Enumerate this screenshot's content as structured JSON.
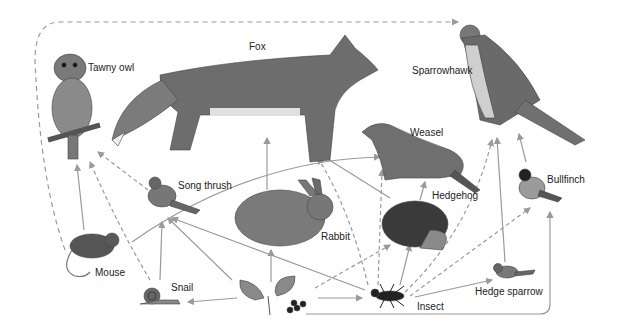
{
  "diagram": {
    "title": "",
    "type": "food-web",
    "organisms": [
      {
        "id": "tawny-owl",
        "label": "Tawny owl",
        "x": 88,
        "y": 68
      },
      {
        "id": "fox",
        "label": "Fox",
        "x": 249,
        "y": 47
      },
      {
        "id": "sparrowhawk",
        "label": "Sparrowhawk",
        "x": 412,
        "y": 71
      },
      {
        "id": "weasel",
        "label": "Weasel",
        "x": 410,
        "y": 133
      },
      {
        "id": "song-thrush",
        "label": "Song thrush",
        "x": 178,
        "y": 186
      },
      {
        "id": "bullfinch",
        "label": "Bullfinch",
        "x": 547,
        "y": 180
      },
      {
        "id": "hedgehog",
        "label": "Hedgehog",
        "x": 432,
        "y": 196
      },
      {
        "id": "rabbit",
        "label": "Rabbit",
        "x": 321,
        "y": 237
      },
      {
        "id": "mouse",
        "label": "Mouse",
        "x": 95,
        "y": 268
      },
      {
        "id": "snail",
        "label": "Snail",
        "x": 171,
        "y": 283
      },
      {
        "id": "hedge-sparrow",
        "label": "Hedge sparrow",
        "x": 475,
        "y": 292
      },
      {
        "id": "insect",
        "label": "Insect",
        "x": 417,
        "y": 302
      },
      {
        "id": "plant",
        "label": "",
        "x": 270,
        "y": 290
      }
    ],
    "legend": {
      "solid_arrow": "eaten by (primary link)",
      "dashed_arrow": "eaten by (secondary link)"
    },
    "colors": {
      "arrow": "#9a9a9a",
      "label": "#222222",
      "background": "#ffffff",
      "illustration": "#555555"
    }
  }
}
